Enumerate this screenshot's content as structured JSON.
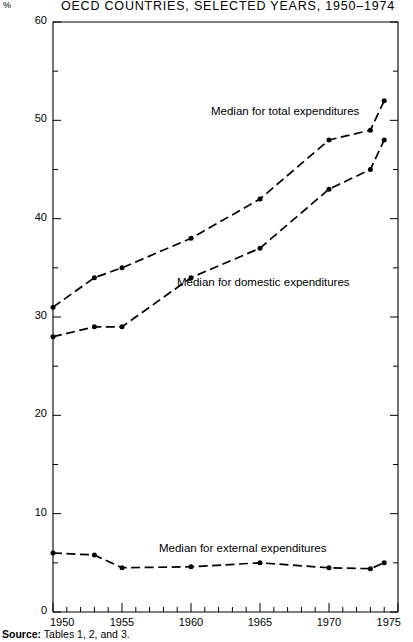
{
  "title": "OECD  COUNTRIES,  SELECTED  YEARS,  1950–1974",
  "axis_unit_label": "%",
  "source": {
    "label": "Source:",
    "text": "Tables 1, 2, and 3."
  },
  "annotations": {
    "total": "Median for total expenditures",
    "domestic": "Median for domestic expenditures",
    "external": "Median for external expenditures"
  },
  "chart_data": {
    "type": "line",
    "title": "OECD  COUNTRIES,  SELECTED  YEARS,  1950–1974",
    "xlabel": "",
    "ylabel": "%",
    "xlim": [
      1950,
      1975
    ],
    "ylim": [
      0,
      60
    ],
    "xticks": [
      1950,
      1955,
      1960,
      1965,
      1970,
      1975
    ],
    "xticklabels": [
      "1950",
      "1955",
      "1960",
      "1965",
      "1970",
      "1975"
    ],
    "yticks": [
      0,
      10,
      20,
      30,
      40,
      50,
      60
    ],
    "yticklabels": [
      "0",
      "10",
      "20",
      "30",
      "40",
      "50",
      "60"
    ],
    "yminorticks": [
      5,
      15,
      25,
      35,
      45,
      55
    ],
    "xminorstep": 1,
    "grid": false,
    "legend": "inline-annotations",
    "x": [
      1950,
      1953,
      1955,
      1960,
      1965,
      1970,
      1973,
      1974
    ],
    "series": [
      {
        "name": "Median for total expenditures",
        "values": [
          31,
          34,
          35,
          38,
          42,
          48,
          49,
          52
        ]
      },
      {
        "name": "Median for domestic expenditures",
        "values": [
          28,
          29,
          29,
          34,
          37,
          43,
          45,
          48
        ]
      },
      {
        "name": "Median for external expenditures",
        "values": [
          6,
          5.8,
          4.5,
          4.6,
          5,
          4.5,
          4.4,
          5
        ]
      }
    ],
    "style": {
      "line": "dashed",
      "marker": "filled-circle",
      "color": "#000000"
    }
  }
}
